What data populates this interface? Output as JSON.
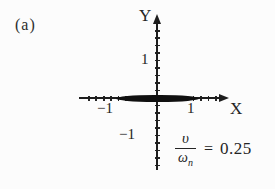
{
  "figure": {
    "panel_label": "(a)",
    "y_axis": {
      "label": "Y",
      "tick_positive": "1",
      "tick_negative": "−1"
    },
    "x_axis": {
      "label": "X",
      "tick_positive": "1",
      "tick_negative": "−1"
    },
    "formula": {
      "numerator": "υ",
      "denominator_base": "ω",
      "denominator_subscript": "n",
      "equals_sign": "=",
      "value": "0.25"
    },
    "colors": {
      "ink": "#1e1e1e",
      "ellipse_fill": "#101010",
      "background": "#fcfcfc"
    }
  },
  "chart_data": {
    "type": "line",
    "xlabel": "X",
    "ylabel": "Y",
    "xlim": [
      -2.1,
      1.9
    ],
    "ylim": [
      -1.9,
      2.2
    ],
    "x_ticks": [
      -1,
      1
    ],
    "y_ticks": [
      -1,
      1
    ],
    "grid": false,
    "legend": "none",
    "series": [
      {
        "name": "closed orbit (filled ellipse)",
        "shape": "filled_ellipse",
        "center_x": 0,
        "center_y": 0,
        "semi_axis_x": 1.05,
        "semi_axis_y": 0.1
      }
    ],
    "annotations": [
      {
        "text": "υ/ωₙ = 0.25",
        "position": "lower-right"
      }
    ]
  }
}
